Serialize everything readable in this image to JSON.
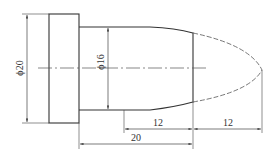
{
  "diagram": {
    "type": "mechanical-part-drawing",
    "colors": {
      "outline": "#333333",
      "dimension": "#444444",
      "centerline": "#555555",
      "background": "#ffffff"
    },
    "dimensions": {
      "flange_diameter": "ϕ20",
      "shaft_diameter": "ϕ16",
      "shaft_length_partial": "12",
      "tip_length": "12",
      "shaft_length_total": "20"
    }
  }
}
